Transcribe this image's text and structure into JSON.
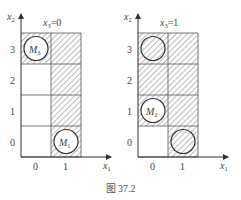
{
  "figure": {
    "caption": "图 37.2",
    "panels": [
      {
        "title_var": "x",
        "title_sub": "3",
        "title_val": "=0",
        "y_axis_label": "x",
        "y_axis_sub": "2",
        "x_axis_label": "x",
        "x_axis_sub": "1",
        "y_ticks": [
          "3",
          "2",
          "1",
          "0"
        ],
        "x_ticks": [
          "0",
          "1"
        ],
        "hatched_cells": [
          [
            0,
            3
          ],
          [
            1,
            3
          ],
          [
            1,
            2
          ],
          [
            1,
            1
          ],
          [
            1,
            0
          ]
        ],
        "circles": [
          {
            "col": 0,
            "row": 3,
            "label": "M",
            "sub": "3"
          },
          {
            "col": 1,
            "row": 0,
            "label": "M",
            "sub": "1"
          }
        ]
      },
      {
        "title_var": "x",
        "title_sub": "3",
        "title_val": "=1",
        "y_axis_label": "x",
        "y_axis_sub": "2",
        "x_axis_label": "x",
        "x_axis_sub": "1",
        "y_ticks": [
          "3",
          "2",
          "1",
          "0"
        ],
        "x_ticks": [
          "0",
          "1"
        ],
        "hatched_cells": [
          [
            0,
            3
          ],
          [
            1,
            3
          ],
          [
            0,
            2
          ],
          [
            1,
            2
          ],
          [
            0,
            1
          ],
          [
            1,
            1
          ],
          [
            1,
            0
          ]
        ],
        "circles": [
          {
            "col": 0,
            "row": 3,
            "label": "",
            "sub": ""
          },
          {
            "col": 0,
            "row": 1,
            "label": "M",
            "sub": "2"
          },
          {
            "col": 1,
            "row": 0,
            "label": "",
            "sub": ""
          }
        ]
      }
    ]
  }
}
